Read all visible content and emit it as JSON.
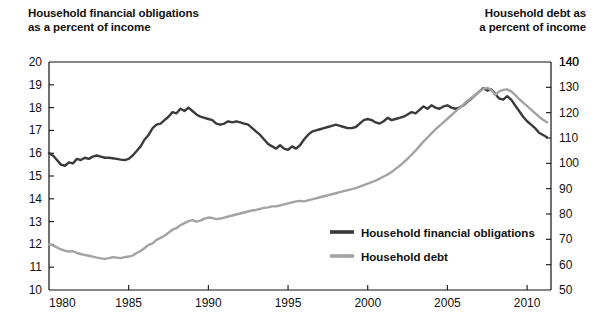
{
  "titles": {
    "left_line1": "Household financial obligations",
    "left_line2": "as a percent of income",
    "right_line1": "Household debt as",
    "right_line2": "a percent of income"
  },
  "colors": {
    "obligations": "#3a3a3a",
    "debt": "#a3a3a3",
    "axis": "#111111",
    "background": "#ffffff"
  },
  "chart_data": {
    "type": "line",
    "xlabel": "",
    "ylabel": "Household financial obligations as a percent of income",
    "y2label": "Household debt as a percent of income",
    "grid": false,
    "legend_position": "inside-center-right",
    "xlim": [
      1980,
      2011.5
    ],
    "ylim": [
      10,
      20
    ],
    "y2lim": [
      50,
      140
    ],
    "xticks": [
      1980,
      1985,
      1990,
      1995,
      2000,
      2005,
      2010
    ],
    "xticklabels": [
      "1980",
      "1985",
      "1990",
      "1995",
      "2000",
      "2005",
      "2010"
    ],
    "yticks": [
      10,
      11,
      12,
      13,
      14,
      15,
      16,
      17,
      18,
      19,
      20
    ],
    "yticklabels": [
      "10",
      "11",
      "12",
      "13",
      "14",
      "15",
      "16",
      "17",
      "18",
      "19",
      "20"
    ],
    "y2ticks": [
      50,
      60,
      70,
      80,
      90,
      100,
      110,
      120,
      130,
      140
    ],
    "y2ticklabels": [
      "50",
      "60",
      "70",
      "80",
      "90",
      "100",
      "110",
      "120",
      "130",
      "140"
    ],
    "series": [
      {
        "name": "Household financial obligations",
        "axis": "left",
        "color": "#3a3a3a",
        "units": "percent of income",
        "x": [
          1980.0,
          1980.25,
          1980.5,
          1980.75,
          1981.0,
          1981.25,
          1981.5,
          1981.75,
          1982.0,
          1982.25,
          1982.5,
          1982.75,
          1983.0,
          1983.25,
          1983.5,
          1983.75,
          1984.0,
          1984.25,
          1984.5,
          1984.75,
          1985.0,
          1985.25,
          1985.5,
          1985.75,
          1986.0,
          1986.25,
          1986.5,
          1986.75,
          1987.0,
          1987.25,
          1987.5,
          1987.75,
          1988.0,
          1988.25,
          1988.5,
          1988.75,
          1989.0,
          1989.25,
          1989.5,
          1989.75,
          1990.0,
          1990.25,
          1990.5,
          1990.75,
          1991.0,
          1991.25,
          1991.5,
          1991.75,
          1992.0,
          1992.25,
          1992.5,
          1992.75,
          1993.0,
          1993.25,
          1993.5,
          1993.75,
          1994.0,
          1994.25,
          1994.5,
          1994.75,
          1995.0,
          1995.25,
          1995.5,
          1995.75,
          1996.0,
          1996.25,
          1996.5,
          1996.75,
          1997.0,
          1997.25,
          1997.5,
          1997.75,
          1998.0,
          1998.25,
          1998.5,
          1998.75,
          1999.0,
          1999.25,
          1999.5,
          1999.75,
          2000.0,
          2000.25,
          2000.5,
          2000.75,
          2001.0,
          2001.25,
          2001.5,
          2001.75,
          2002.0,
          2002.25,
          2002.5,
          2002.75,
          2003.0,
          2003.25,
          2003.5,
          2003.75,
          2004.0,
          2004.25,
          2004.5,
          2004.75,
          2005.0,
          2005.25,
          2005.5,
          2005.75,
          2006.0,
          2006.25,
          2006.5,
          2006.75,
          2007.0,
          2007.25,
          2007.5,
          2007.75,
          2008.0,
          2008.25,
          2008.5,
          2008.75,
          2009.0,
          2009.25,
          2009.5,
          2009.75,
          2010.0,
          2010.25,
          2010.5,
          2010.75,
          2011.0,
          2011.25
        ],
        "y": [
          16.0,
          15.9,
          15.7,
          15.5,
          15.45,
          15.6,
          15.55,
          15.75,
          15.7,
          15.8,
          15.75,
          15.85,
          15.9,
          15.85,
          15.8,
          15.8,
          15.78,
          15.75,
          15.72,
          15.7,
          15.75,
          15.9,
          16.1,
          16.3,
          16.6,
          16.8,
          17.1,
          17.25,
          17.3,
          17.45,
          17.6,
          17.8,
          17.75,
          17.95,
          17.85,
          18.0,
          17.85,
          17.7,
          17.6,
          17.55,
          17.5,
          17.45,
          17.3,
          17.25,
          17.3,
          17.4,
          17.35,
          17.4,
          17.35,
          17.3,
          17.25,
          17.1,
          16.95,
          16.8,
          16.6,
          16.4,
          16.3,
          16.2,
          16.35,
          16.2,
          16.15,
          16.3,
          16.2,
          16.35,
          16.6,
          16.8,
          16.95,
          17.0,
          17.05,
          17.1,
          17.15,
          17.2,
          17.25,
          17.2,
          17.15,
          17.1,
          17.1,
          17.15,
          17.3,
          17.45,
          17.5,
          17.45,
          17.35,
          17.3,
          17.4,
          17.55,
          17.45,
          17.5,
          17.55,
          17.6,
          17.7,
          17.8,
          17.75,
          17.9,
          18.05,
          17.95,
          18.1,
          18.0,
          17.95,
          18.05,
          18.1,
          18.0,
          17.95,
          18.0,
          18.1,
          18.25,
          18.4,
          18.55,
          18.7,
          18.85,
          18.75,
          18.8,
          18.6,
          18.4,
          18.35,
          18.5,
          18.35,
          18.1,
          17.85,
          17.6,
          17.4,
          17.25,
          17.1,
          16.9,
          16.8,
          16.7
        ]
      },
      {
        "name": "Household debt",
        "axis": "right",
        "color": "#a3a3a3",
        "units": "percent of income",
        "x": [
          1980.0,
          1980.25,
          1980.5,
          1980.75,
          1981.0,
          1981.25,
          1981.5,
          1981.75,
          1982.0,
          1982.25,
          1982.5,
          1982.75,
          1983.0,
          1983.25,
          1983.5,
          1983.75,
          1984.0,
          1984.25,
          1984.5,
          1984.75,
          1985.0,
          1985.25,
          1985.5,
          1985.75,
          1986.0,
          1986.25,
          1986.5,
          1986.75,
          1987.0,
          1987.25,
          1987.5,
          1987.75,
          1988.0,
          1988.25,
          1988.5,
          1988.75,
          1989.0,
          1989.25,
          1989.5,
          1989.75,
          1990.0,
          1990.25,
          1990.5,
          1990.75,
          1991.0,
          1991.25,
          1991.5,
          1991.75,
          1992.0,
          1992.25,
          1992.5,
          1992.75,
          1993.0,
          1993.25,
          1993.5,
          1993.75,
          1994.0,
          1994.25,
          1994.5,
          1994.75,
          1995.0,
          1995.25,
          1995.5,
          1995.75,
          1996.0,
          1996.25,
          1996.5,
          1996.75,
          1997.0,
          1997.25,
          1997.5,
          1997.75,
          1998.0,
          1998.25,
          1998.5,
          1998.75,
          1999.0,
          1999.25,
          1999.5,
          1999.75,
          2000.0,
          2000.25,
          2000.5,
          2000.75,
          2001.0,
          2001.25,
          2001.5,
          2001.75,
          2002.0,
          2002.25,
          2002.5,
          2002.75,
          2003.0,
          2003.25,
          2003.5,
          2003.75,
          2004.0,
          2004.25,
          2004.5,
          2004.75,
          2005.0,
          2005.25,
          2005.5,
          2005.75,
          2006.0,
          2006.25,
          2006.5,
          2006.75,
          2007.0,
          2007.25,
          2007.5,
          2007.75,
          2008.0,
          2008.25,
          2008.5,
          2008.75,
          2009.0,
          2009.25,
          2009.5,
          2009.75,
          2010.0,
          2010.25,
          2010.5,
          2010.75,
          2011.0,
          2011.25
        ],
        "y": [
          68.0,
          67.6,
          66.8,
          66.0,
          65.5,
          65.2,
          65.3,
          64.6,
          64.2,
          63.8,
          63.5,
          63.2,
          62.8,
          62.5,
          62.3,
          62.6,
          63.0,
          62.8,
          62.6,
          63.0,
          63.2,
          63.6,
          64.6,
          65.4,
          66.6,
          67.8,
          68.4,
          69.8,
          70.6,
          71.4,
          72.6,
          73.8,
          74.4,
          75.6,
          76.4,
          77.2,
          77.6,
          77.0,
          77.4,
          78.2,
          78.6,
          78.4,
          78.0,
          78.2,
          78.6,
          79.0,
          79.4,
          79.8,
          80.2,
          80.6,
          81.0,
          81.4,
          81.6,
          82.0,
          82.4,
          82.6,
          83.0,
          83.0,
          83.4,
          83.8,
          84.2,
          84.6,
          85.0,
          85.2,
          85.0,
          85.4,
          85.8,
          86.2,
          86.6,
          87.0,
          87.4,
          87.8,
          88.2,
          88.6,
          89.0,
          89.4,
          89.8,
          90.2,
          90.8,
          91.4,
          92.0,
          92.6,
          93.2,
          94.0,
          94.8,
          95.6,
          96.6,
          97.8,
          99.0,
          100.4,
          101.8,
          103.4,
          105.0,
          106.8,
          108.6,
          110.2,
          111.8,
          113.4,
          114.8,
          116.2,
          117.6,
          119.0,
          120.4,
          121.8,
          123.2,
          124.6,
          125.8,
          127.0,
          128.2,
          129.4,
          129.8,
          129.0,
          127.0,
          128.4,
          129.0,
          129.2,
          128.4,
          127.0,
          125.4,
          124.0,
          122.6,
          121.2,
          119.8,
          118.4,
          117.2,
          116.2
        ]
      }
    ],
    "legend": [
      {
        "label": "Household financial obligations",
        "color": "#3a3a3a"
      },
      {
        "label": "Household debt",
        "color": "#a3a3a3"
      }
    ]
  }
}
